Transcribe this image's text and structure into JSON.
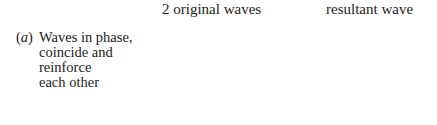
{
  "figure": {
    "label_tag": "(a)",
    "label_lines": [
      "Waves in phase,",
      "coincide and",
      "reinforce",
      "each other"
    ],
    "titles": {
      "original": "2 original waves",
      "resultant": "resultant wave"
    },
    "colors": {
      "original_solid": "#555555",
      "original_dashed": "#9a9a9a",
      "resultant": "#a8a8a8"
    }
  }
}
